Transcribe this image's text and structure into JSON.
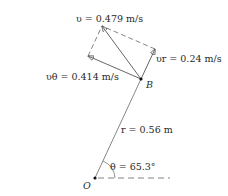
{
  "diagram": {
    "labels": {
      "v": "υ = 0.479 m/s",
      "vr": "υr = 0.24 m/s",
      "vtheta": "υθ = 0.414 m/s",
      "point_b": "B",
      "r": "r = 0.56 m",
      "theta": "θ = 65.3°",
      "origin": "O"
    },
    "values": {
      "v": "0.479 m/s",
      "vr": "0.24 m/s",
      "vtheta": "0.414 m/s",
      "r": "0.56 m",
      "theta": "65.3°"
    },
    "colors": {
      "line": "#555555",
      "text": "#2a2a2a"
    }
  }
}
